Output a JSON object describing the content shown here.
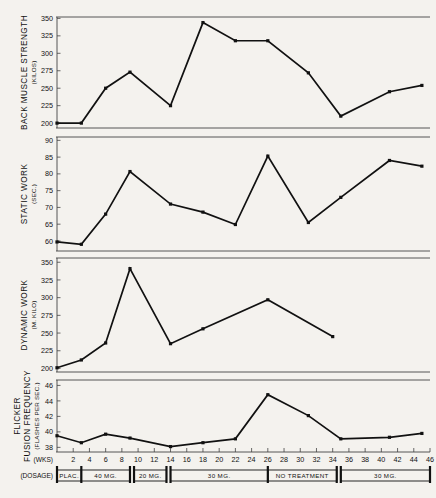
{
  "figure": {
    "title": "",
    "xaxis_label": "(WKS)",
    "dosage_label": "(DOSAGE)",
    "x_ticks": [
      2,
      4,
      6,
      8,
      10,
      12,
      14,
      16,
      18,
      20,
      22,
      24,
      26,
      28,
      30,
      32,
      34,
      36,
      38,
      40,
      42,
      44,
      46
    ],
    "x_range": [
      0,
      46
    ],
    "line_color": "#111111",
    "background_color": "#f4f2ee"
  },
  "dosage_timeline": {
    "segments": [
      {
        "label": "PLAC.",
        "start": 0,
        "end": 3
      },
      {
        "label": "40 MG.",
        "start": 3,
        "end": 9
      },
      {
        "label": "20 MG.",
        "start": 9.5,
        "end": 13.5
      },
      {
        "label": "30 MG.",
        "start": 14,
        "end": 26
      },
      {
        "label": "NO TREATMENT",
        "start": 26,
        "end": 34.5
      },
      {
        "label": "30 MG.",
        "start": 35,
        "end": 46
      }
    ]
  },
  "chart_data": [
    {
      "type": "line",
      "title": "",
      "ylabel": "BACK MUSCLE STRENGTH",
      "ylabel_units": "(KILOS)",
      "xlabel": "",
      "ylim": [
        193,
        352
      ],
      "y_ticks": [
        200,
        225,
        250,
        275,
        300,
        325,
        350
      ],
      "xlim": [
        0,
        46
      ],
      "grid": false,
      "legend": "none",
      "x": [
        0,
        3,
        6,
        9,
        14,
        18,
        22,
        26,
        31,
        35,
        41,
        45
      ],
      "values": [
        200,
        200,
        250,
        273,
        225,
        344,
        318,
        318,
        272,
        210,
        245,
        254
      ]
    },
    {
      "type": "line",
      "title": "",
      "ylabel": "STATIC WORK",
      "ylabel_units": "(SEC.)",
      "xlabel": "",
      "ylim": [
        57,
        91
      ],
      "y_ticks": [
        60,
        65,
        70,
        75,
        80,
        85,
        90
      ],
      "xlim": [
        0,
        46
      ],
      "grid": false,
      "legend": "none",
      "x": [
        0,
        3,
        6,
        9,
        14,
        18,
        22,
        26,
        31,
        35,
        41,
        45
      ],
      "values": [
        59.7,
        59.0,
        68.0,
        80.7,
        71.0,
        68.6,
        64.9,
        85.3,
        65.5,
        73.0,
        84.0,
        82.3
      ]
    },
    {
      "type": "line",
      "title": "",
      "ylabel": "DYNAMIC WORK",
      "ylabel_units": "(M. KILO)",
      "xlabel": "",
      "ylim": [
        195,
        356
      ],
      "y_ticks": [
        200,
        225,
        250,
        275,
        300,
        325,
        350
      ],
      "xlim": [
        0,
        46
      ],
      "grid": false,
      "legend": "none",
      "x": [
        0,
        3,
        6,
        9,
        14,
        18,
        26,
        34
      ],
      "values": [
        201,
        212,
        236,
        341,
        235,
        256,
        297,
        245
      ]
    },
    {
      "type": "line",
      "title": "",
      "ylabel_line1": "FLICKER",
      "ylabel": "FUSION FREQUENCY",
      "ylabel_units": "(FLASHES PER SEC.)",
      "xlabel": "(WKS)",
      "ylim": [
        37.4,
        46.7
      ],
      "y_ticks": [
        38,
        40,
        42,
        44,
        46
      ],
      "xlim": [
        0,
        46
      ],
      "grid": false,
      "legend": "none",
      "x": [
        0,
        3,
        6,
        9,
        14,
        18,
        22,
        26,
        31,
        35,
        41,
        45
      ],
      "values": [
        39.5,
        38.6,
        39.7,
        39.2,
        38.1,
        38.6,
        39.1,
        44.8,
        42.1,
        39.1,
        39.3,
        39.8
      ]
    }
  ]
}
